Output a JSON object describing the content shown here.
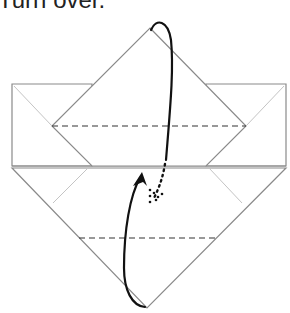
{
  "instruction": {
    "text": "Turn over."
  },
  "diagram": {
    "type": "origami-step",
    "action": "turn-over",
    "colors": {
      "paper_edge": "#8a8a8a",
      "crease": "#bdbdbd",
      "fold_line": "#333333",
      "arrow": "#111111"
    },
    "elements": [
      {
        "name": "upper-diamond-flap",
        "kind": "polygon"
      },
      {
        "name": "left-rect",
        "kind": "polygon"
      },
      {
        "name": "right-rect",
        "kind": "polygon"
      },
      {
        "name": "lower-triangle",
        "kind": "polygon"
      },
      {
        "name": "upper-valley-fold-line",
        "kind": "dashed-line"
      },
      {
        "name": "lower-valley-fold-line",
        "kind": "dashed-line"
      },
      {
        "name": "turn-over-arrow",
        "kind": "curved-arrow"
      }
    ]
  }
}
